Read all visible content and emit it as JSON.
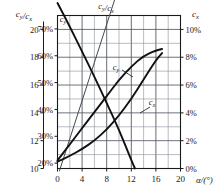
{
  "chart_data": {
    "type": "line",
    "title": "",
    "xlabel": "α/(°)",
    "ylabel_left_outer": "c_y/c_x",
    "ylabel_left_inner": "c_y",
    "ylabel_right": "c_x",
    "xlim": [
      0,
      20
    ],
    "xticks": [
      "0",
      "4",
      "8",
      "12",
      "16",
      "20"
    ],
    "xtick_values": [
      0,
      4,
      8,
      12,
      16,
      20
    ],
    "x_minor_step": 2,
    "left_outer_axis": {
      "label": "c_y/c_x",
      "ylim": [
        10,
        21
      ],
      "ticks": [
        "10",
        "12",
        "14",
        "16",
        "18",
        "20"
      ],
      "tick_values": [
        10,
        12,
        14,
        16,
        18,
        20
      ]
    },
    "left_inner_axis": {
      "label": "c_y",
      "ylim": [
        0.18,
        0.75
      ],
      "ticks": [
        "20%",
        "30%",
        "40%",
        "50%",
        "60%",
        "70%"
      ],
      "tick_values": [
        20,
        30,
        40,
        50,
        60,
        70
      ]
    },
    "right_axis": {
      "label": "c_x",
      "ylim": [
        0,
        11
      ],
      "ticks": [
        "0%",
        "2%",
        "4%",
        "6%",
        "8%",
        "10%"
      ],
      "tick_values": [
        0,
        2,
        4,
        6,
        8,
        10
      ]
    },
    "grid": true,
    "legend": "inline-annotations",
    "series": [
      {
        "name": "c_y/c_x",
        "label": "c_y/c_x",
        "axis": "left_outer",
        "style": "thin",
        "x": [
          0,
          1,
          2,
          4,
          6,
          8,
          10,
          12,
          12.6
        ],
        "values": [
          9.6,
          11.0,
          12.3,
          15.0,
          17.6,
          20.1,
          22.6,
          25.0,
          25.8
        ],
        "label_position": "top"
      },
      {
        "name": "c_y",
        "label": "c_y",
        "axis": "left_inner",
        "style": "thick",
        "x": [
          0,
          2,
          4,
          6,
          8,
          10,
          12,
          14,
          16,
          17
        ],
        "values": [
          21,
          27,
          33,
          39,
          45,
          51,
          56,
          60,
          62,
          62.5
        ],
        "label_position": "mid-upper"
      },
      {
        "name": "c_x",
        "label": "c_x",
        "axis": "right",
        "style": "thick",
        "x": [
          0,
          2,
          4,
          6,
          8,
          10,
          12,
          14,
          16,
          17
        ],
        "values": [
          0.5,
          0.9,
          1.4,
          2.0,
          2.8,
          3.8,
          5.0,
          6.4,
          7.8,
          8.3
        ],
        "label_position": "mid-lower"
      },
      {
        "name": "descending",
        "label": "c_y",
        "axis": "left_outer",
        "style": "thick",
        "x": [
          0,
          2,
          4,
          6,
          8,
          10,
          12,
          12.6
        ],
        "values": [
          21.9,
          20.2,
          18.4,
          16.6,
          14.7,
          12.8,
          10.6,
          10.0
        ],
        "label_position": "top-left"
      }
    ]
  },
  "annotations": {
    "cy_cx_top": "c_y/c_x",
    "cy_curve": "c_y",
    "cx_curve": "c_x",
    "cy_start": "c_y",
    "axis_left_top": "c_y/c_x",
    "axis_right_top": "c_x",
    "axis_bottom": "α/(°)"
  },
  "colors": {
    "ink": "#1a1a1a",
    "grid_major": "#555a63",
    "grid_minor": "#8a8f98",
    "curve": "#111111",
    "thin_curve": "#3a3f46",
    "background": "#ffffff"
  }
}
